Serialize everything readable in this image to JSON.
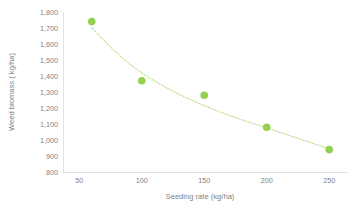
{
  "chart_data": {
    "type": "scatter",
    "title": "",
    "subtitle": "",
    "xlabel": "Seeding rate (kg/ha)",
    "ylabel": "Weed biomass ( kg/ha)",
    "x": [
      60,
      100,
      150,
      200,
      250
    ],
    "values": [
      1740,
      1370,
      1280,
      1080,
      940
    ],
    "series": [
      {
        "name": "Weed biomass",
        "x": [
          60,
          100,
          150,
          200,
          250
        ],
        "values": [
          1740,
          1370,
          1280,
          1080,
          940
        ]
      }
    ],
    "xlim": [
      37,
      265
    ],
    "ylim": [
      800,
      1800
    ],
    "xticks": [
      50,
      100,
      150,
      200,
      250
    ],
    "yticks": [
      800,
      900,
      1000,
      1100,
      1200,
      1300,
      1400,
      1500,
      1600,
      1700,
      1800
    ],
    "xtick_labels": [
      "50",
      "100",
      "150",
      "200",
      "250"
    ],
    "ytick_labels": [
      "800",
      "900",
      "1,000",
      "1,100",
      "1,200",
      "1,300",
      "1,400",
      "1,500",
      "1,600",
      "1,700",
      "1,800"
    ],
    "grid": false,
    "legend": "none",
    "trendline": {
      "present": true,
      "style": "dotted",
      "shape": "exponential-decay",
      "color": "#B6D77A",
      "points": [
        {
          "x": 60,
          "y": 1700
        },
        {
          "x": 80,
          "y": 1545
        },
        {
          "x": 100,
          "y": 1420
        },
        {
          "x": 125,
          "y": 1305
        },
        {
          "x": 150,
          "y": 1215
        },
        {
          "x": 175,
          "y": 1140
        },
        {
          "x": 200,
          "y": 1075
        },
        {
          "x": 225,
          "y": 1010
        },
        {
          "x": 250,
          "y": 945
        }
      ]
    },
    "marker_color": "#92D050",
    "marker_size": 5.2,
    "axis_color": "#D9D9D9",
    "tick_label_color": "#7F7F7F",
    "axis_title_color": "#7F7F7F",
    "background_color": "#FFFFFF"
  },
  "plot_geometry": {
    "left": 63,
    "right": 348,
    "top": 12,
    "bottom": 172
  }
}
